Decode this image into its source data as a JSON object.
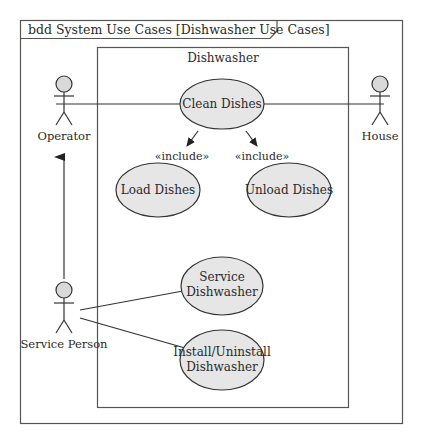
{
  "diagram": {
    "frame_title": "bdd System Use Cases [Dishwasher Use Cases]",
    "system_boundary": {
      "label": "Dishwasher"
    },
    "actors": [
      {
        "id": "operator",
        "label": "Operator"
      },
      {
        "id": "house",
        "label": "House"
      },
      {
        "id": "service_person",
        "label": "Service Person"
      }
    ],
    "use_cases": [
      {
        "id": "clean_dishes",
        "lines": [
          "Clean Dishes"
        ]
      },
      {
        "id": "load_dishes",
        "lines": [
          "Load Dishes"
        ]
      },
      {
        "id": "unload_dishes",
        "lines": [
          "Unload Dishes"
        ]
      },
      {
        "id": "service_dishwasher",
        "lines": [
          "Service",
          "Dishwasher"
        ]
      },
      {
        "id": "install_uninstall",
        "lines": [
          "Install/Uninstall",
          "Dishwasher"
        ]
      }
    ],
    "relationships": [
      {
        "from": "operator",
        "to": "clean_dishes",
        "type": "association"
      },
      {
        "from": "house",
        "to": "clean_dishes",
        "type": "association"
      },
      {
        "from": "clean_dishes",
        "to": "load_dishes",
        "type": "include",
        "label": "«include»"
      },
      {
        "from": "clean_dishes",
        "to": "unload_dishes",
        "type": "include",
        "label": "«include»"
      },
      {
        "from": "service_person",
        "to": "operator",
        "type": "generalization"
      },
      {
        "from": "service_person",
        "to": "service_dishwasher",
        "type": "association"
      },
      {
        "from": "service_person",
        "to": "install_uninstall",
        "type": "association"
      }
    ],
    "colors": {
      "use_case_fill": "#e6e6e6",
      "actor_head_fill": "#d9d9d9",
      "line": "#333333",
      "frame": "#555555"
    }
  }
}
